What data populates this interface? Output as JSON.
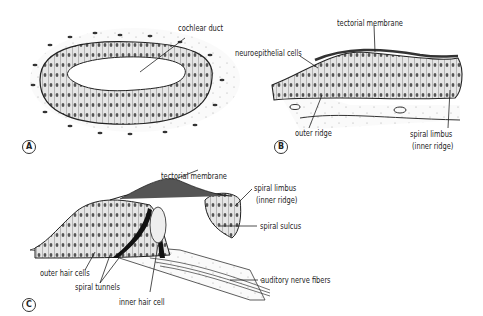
{
  "panels": {
    "A": {
      "letter": "A",
      "labels": {
        "cochlear_duct": "cochlear duct"
      }
    },
    "B": {
      "letter": "B",
      "labels": {
        "tectorial_membrane": "tectorial membrane",
        "neuroepithelial_cells": "neuroepithelial cells",
        "outer_ridge": "outer ridge",
        "spiral_limbus": "spiral limbus",
        "inner_ridge": "(inner ridge)"
      }
    },
    "C": {
      "letter": "C",
      "labels": {
        "tectorial_membrane": "tectorial membrane",
        "spiral_limbus": "spiral limbus",
        "inner_ridge": "(inner ridge)",
        "spiral_sulcus": "spiral sulcus",
        "auditory_nerve_fibers": "auditory nerve fibers",
        "outer_hair_cells": "outer hair cells",
        "spiral_tunnels": "spiral tunnels",
        "inner_hair_cell": "inner hair cell"
      }
    }
  },
  "colors": {
    "ink": "#222222",
    "cell_fill": "#d9d9d9",
    "background": "#ffffff"
  }
}
